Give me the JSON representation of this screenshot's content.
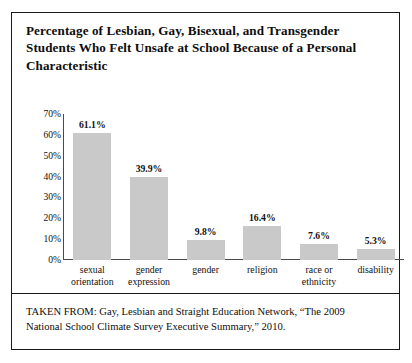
{
  "figure": {
    "title": "Percentage of Lesbian, Gay, Bisexual, and Transgender Students Who Felt Unsafe at School Because of a Personal Characteristic",
    "source_caption": "TAKEN FROM: Gay, Lesbian and Straight Education Network, “The 2009 National School Climate Survey Executive Summary,” 2010.",
    "border_color": "#1a1a1a",
    "bar_color": "#c9c9c9",
    "axis_color": "#4a4a4a",
    "text_color": "#0d0d0d"
  },
  "chart_data": {
    "type": "bar",
    "title": "Percentage of Lesbian, Gay, Bisexual, and Transgender Students Who Felt Unsafe at School Because of a Personal Characteristic",
    "xlabel": "",
    "ylabel": "",
    "ylim": [
      0,
      70
    ],
    "grid": false,
    "legend": "none",
    "y_ticks": [
      70,
      60,
      50,
      40,
      30,
      20,
      10,
      0
    ],
    "y_tick_labels": [
      "70%",
      "60%",
      "50%",
      "40%",
      "30%",
      "20%",
      "10%",
      "0%"
    ],
    "categories": [
      "sexual orientation",
      "gender expression",
      "gender",
      "religion",
      "race or ethnicity",
      "disability"
    ],
    "category_lines": [
      [
        "sexual",
        "orientation"
      ],
      [
        "gender",
        "expression"
      ],
      [
        "gender"
      ],
      [
        "religion"
      ],
      [
        "race or",
        "ethnicity"
      ],
      [
        "disability"
      ]
    ],
    "values": [
      61.1,
      39.9,
      9.8,
      16.4,
      7.6,
      5.3
    ],
    "value_labels": [
      "61.1%",
      "39.9%",
      "9.8%",
      "16.4%",
      "7.6%",
      "5.3%"
    ]
  }
}
